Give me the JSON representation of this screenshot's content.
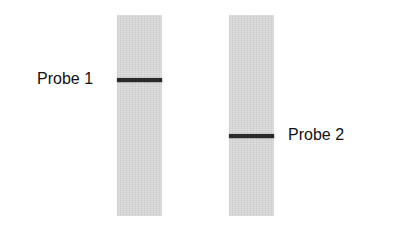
{
  "lanes": [
    {
      "id": "lane-1",
      "left": 117,
      "band_top_offset": 63,
      "label": "Probe 1",
      "label_side": "left"
    },
    {
      "id": "lane-2",
      "left": 229,
      "band_top_offset": 119,
      "label": "Probe 2",
      "label_side": "right"
    }
  ],
  "colors": {
    "lane": "#d6d6d6",
    "band": "#2a2a2a",
    "text": "#111111"
  }
}
